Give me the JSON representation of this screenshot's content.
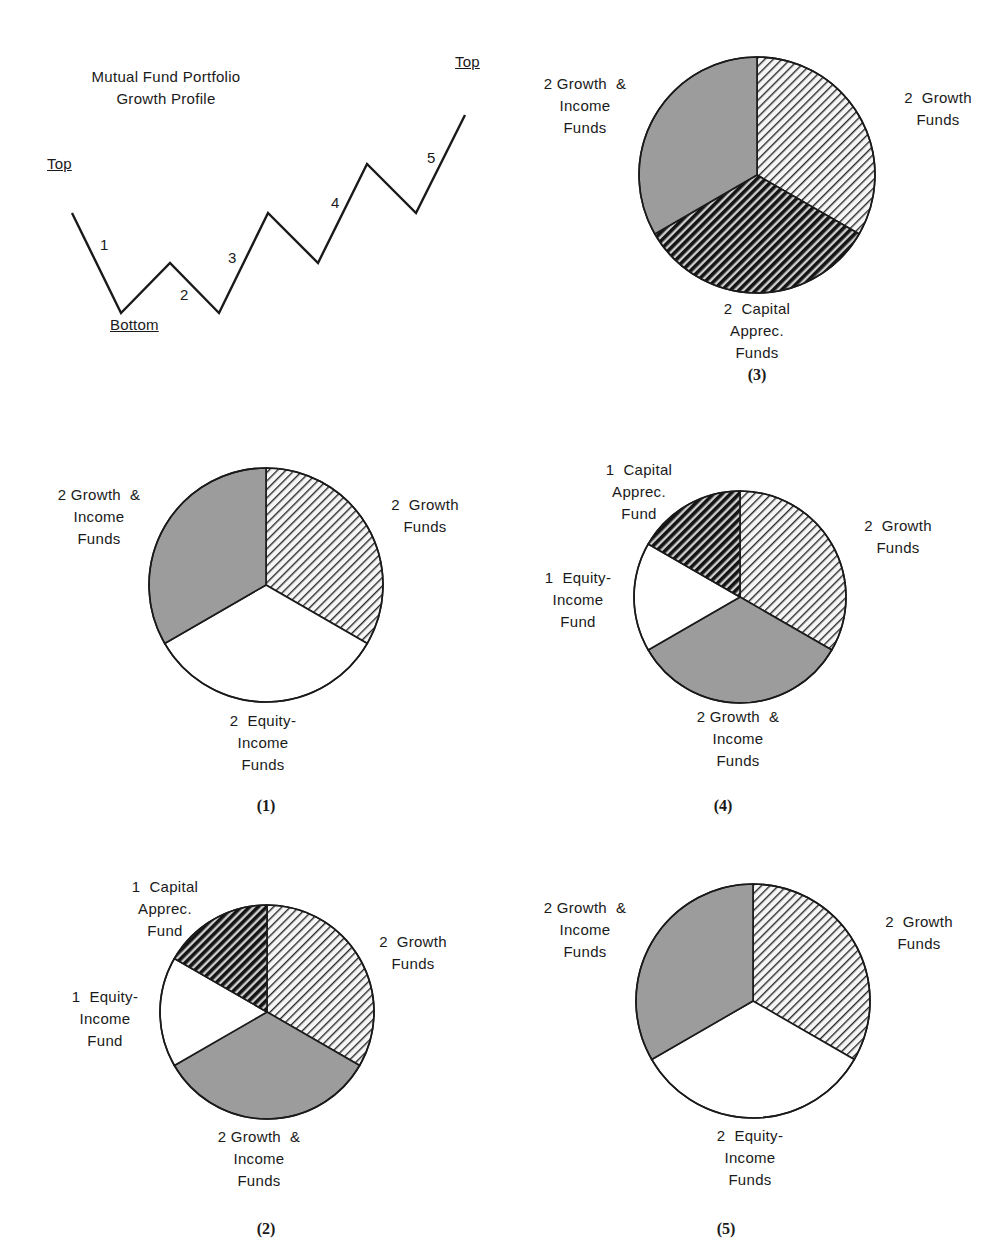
{
  "colors": {
    "ink": "#1a1a1a",
    "gray_fill": "#9c9c9c",
    "white_fill": "#ffffff",
    "hatch_light_bg": "#f4f4f4",
    "hatch_dark_bg": "#6a6a6a"
  },
  "line_chart": {
    "title_lines": [
      "Mutual Fund Portfolio",
      "Growth Profile"
    ],
    "markers": [
      {
        "text": "Top",
        "x": 47,
        "y": 155
      },
      {
        "text": "Bottom",
        "x": 110,
        "y": 316
      },
      {
        "text": "Top",
        "x": 455,
        "y": 53
      }
    ],
    "segment_labels": [
      {
        "text": "1",
        "x": 100,
        "y": 236
      },
      {
        "text": "2",
        "x": 180,
        "y": 286
      },
      {
        "text": "3",
        "x": 228,
        "y": 249
      },
      {
        "text": "4",
        "x": 331,
        "y": 194
      },
      {
        "text": "5",
        "x": 427,
        "y": 149
      }
    ],
    "points": [
      [
        72,
        213
      ],
      [
        121,
        313
      ],
      [
        170,
        263
      ],
      [
        219,
        313
      ],
      [
        268,
        213
      ],
      [
        318,
        263
      ],
      [
        367,
        164
      ],
      [
        416,
        213
      ],
      [
        465,
        115
      ]
    ]
  },
  "chart_data": [
    {
      "type": "line",
      "title": "Mutual Fund Portfolio Growth Profile",
      "xlabel": "",
      "ylabel": "",
      "annotations": [
        "Top",
        "Bottom",
        "Top"
      ],
      "segments": [
        "1",
        "2",
        "3",
        "4",
        "5"
      ],
      "x": [
        0,
        1,
        2,
        3,
        4,
        5,
        6,
        7,
        8
      ],
      "values": [
        2,
        0,
        1,
        0,
        2,
        1,
        3,
        2,
        4
      ],
      "grid": false
    },
    {
      "type": "pie",
      "title": "(1)",
      "categories": [
        "Growth Funds",
        "Equity-Income Funds",
        "Growth & Income Funds"
      ],
      "values": [
        2,
        2,
        2
      ]
    },
    {
      "type": "pie",
      "title": "(2)",
      "categories": [
        "Growth Funds",
        "Growth & Income Funds",
        "Equity-Income Fund",
        "Capital Apprec. Fund"
      ],
      "values": [
        2,
        2,
        1,
        1
      ]
    },
    {
      "type": "pie",
      "title": "(3)",
      "categories": [
        "Growth Funds",
        "Capital Apprec. Funds",
        "Growth & Income Funds"
      ],
      "values": [
        2,
        2,
        2
      ]
    },
    {
      "type": "pie",
      "title": "(4)",
      "categories": [
        "Growth Funds",
        "Growth & Income Funds",
        "Equity-Income Fund",
        "Capital Apprec. Fund"
      ],
      "values": [
        2,
        2,
        1,
        1
      ]
    },
    {
      "type": "pie",
      "title": "(5)",
      "categories": [
        "Growth Funds",
        "Equity-Income Funds",
        "Growth & Income Funds"
      ],
      "values": [
        2,
        2,
        2
      ]
    }
  ],
  "pies": [
    {
      "id": "pie-3",
      "caption": "(3)",
      "cx": 757,
      "cy": 175,
      "r": 118,
      "caption_pos": [
        727,
        366
      ],
      "slices": [
        {
          "value": 2,
          "fill": "hatch-light"
        },
        {
          "value": 2,
          "fill": "hatch-dark"
        },
        {
          "value": 2,
          "fill": "gray"
        }
      ],
      "labels": [
        {
          "lines": [
            "2  Growth",
            "Funds"
          ],
          "x": 888,
          "y": 87,
          "w": 100
        },
        {
          "lines": [
            "2  Capital",
            "Apprec.",
            "Funds"
          ],
          "x": 707,
          "y": 298,
          "w": 100
        },
        {
          "lines": [
            "2 Growth  &",
            "Income",
            "Funds"
          ],
          "x": 530,
          "y": 73,
          "w": 110
        }
      ]
    },
    {
      "id": "pie-1",
      "caption": "(1)",
      "cx": 266,
      "cy": 585,
      "r": 117,
      "caption_pos": [
        236,
        797
      ],
      "slices": [
        {
          "value": 2,
          "fill": "hatch-light"
        },
        {
          "value": 2,
          "fill": "white"
        },
        {
          "value": 2,
          "fill": "gray"
        }
      ],
      "labels": [
        {
          "lines": [
            "2  Growth",
            "Funds"
          ],
          "x": 375,
          "y": 494,
          "w": 100
        },
        {
          "lines": [
            "2  Equity-",
            "Income",
            "Funds"
          ],
          "x": 213,
          "y": 710,
          "w": 100
        },
        {
          "lines": [
            "2 Growth  &",
            "Income",
            "Funds"
          ],
          "x": 44,
          "y": 484,
          "w": 110
        }
      ]
    },
    {
      "id": "pie-4",
      "caption": "(4)",
      "cx": 740,
      "cy": 597,
      "r": 106,
      "caption_pos": [
        693,
        797
      ],
      "slices": [
        {
          "value": 2,
          "fill": "hatch-light"
        },
        {
          "value": 2,
          "fill": "gray"
        },
        {
          "value": 1,
          "fill": "white"
        },
        {
          "value": 1,
          "fill": "hatch-dark"
        }
      ],
      "labels": [
        {
          "lines": [
            "2  Growth",
            "Funds"
          ],
          "x": 848,
          "y": 515,
          "w": 100
        },
        {
          "lines": [
            "2 Growth  &",
            "Income",
            "Funds"
          ],
          "x": 683,
          "y": 706,
          "w": 110
        },
        {
          "lines": [
            "1  Equity-",
            "Income",
            "Fund"
          ],
          "x": 528,
          "y": 567,
          "w": 100
        },
        {
          "lines": [
            "1  Capital",
            "Apprec.",
            "Fund"
          ],
          "x": 589,
          "y": 459,
          "w": 100
        }
      ]
    },
    {
      "id": "pie-2",
      "caption": "(2)",
      "cx": 267,
      "cy": 1012,
      "r": 107,
      "caption_pos": [
        236,
        1220
      ],
      "slices": [
        {
          "value": 2,
          "fill": "hatch-light"
        },
        {
          "value": 2,
          "fill": "gray"
        },
        {
          "value": 1,
          "fill": "white"
        },
        {
          "value": 1,
          "fill": "hatch-dark"
        }
      ],
      "labels": [
        {
          "lines": [
            "2  Growth",
            "Funds"
          ],
          "x": 363,
          "y": 931,
          "w": 100
        },
        {
          "lines": [
            "2 Growth  &",
            "Income",
            "Funds"
          ],
          "x": 204,
          "y": 1126,
          "w": 110
        },
        {
          "lines": [
            "1  Equity-",
            "Income",
            "Fund"
          ],
          "x": 55,
          "y": 986,
          "w": 100
        },
        {
          "lines": [
            "1  Capital",
            "Apprec.",
            "Fund"
          ],
          "x": 115,
          "y": 876,
          "w": 100
        }
      ]
    },
    {
      "id": "pie-5",
      "caption": "(5)",
      "cx": 753,
      "cy": 1001,
      "r": 117,
      "caption_pos": [
        696,
        1220
      ],
      "slices": [
        {
          "value": 2,
          "fill": "hatch-light"
        },
        {
          "value": 2,
          "fill": "white"
        },
        {
          "value": 2,
          "fill": "gray"
        }
      ],
      "labels": [
        {
          "lines": [
            "2  Growth",
            "Funds"
          ],
          "x": 869,
          "y": 911,
          "w": 100
        },
        {
          "lines": [
            "2  Equity-",
            "Income",
            "Funds"
          ],
          "x": 700,
          "y": 1125,
          "w": 100
        },
        {
          "lines": [
            "2 Growth  &",
            "Income",
            "Funds"
          ],
          "x": 530,
          "y": 897,
          "w": 110
        }
      ]
    }
  ]
}
